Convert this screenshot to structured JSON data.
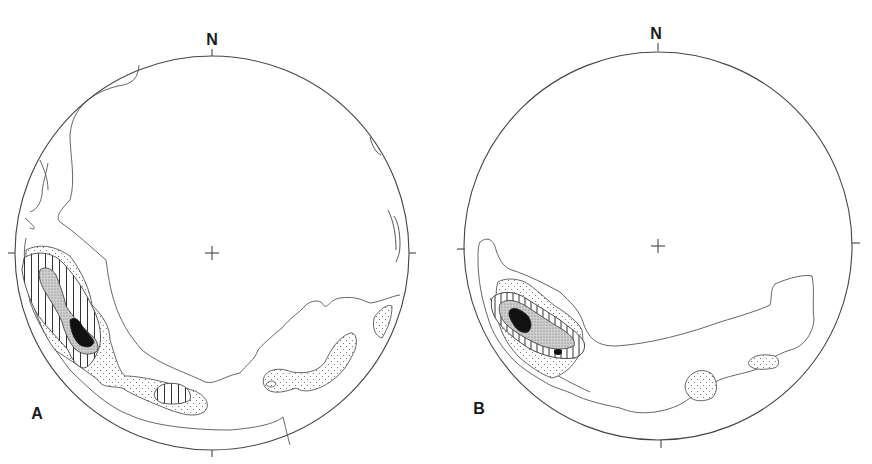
{
  "figure": {
    "panels": [
      {
        "id": "A",
        "panel_label": "A",
        "north_label": "N",
        "projection": "lower-hemisphere equal-area stereonet",
        "center": [
          212,
          253
        ],
        "radius": 197
      },
      {
        "id": "B",
        "panel_label": "B",
        "north_label": "N",
        "projection": "lower-hemisphere equal-area stereonet",
        "center": [
          658,
          246
        ],
        "radius": 194
      }
    ],
    "legend_fills": {
      "level_1": "outline only",
      "level_2": "stipple",
      "level_3": "vertical hatch",
      "level_4": "fine stipple/grey",
      "level_5": "solid black"
    },
    "colors": {
      "line": "#444444",
      "fill_max": "#111111",
      "grey_fill": "#bdbdbd",
      "background": "#ffffff"
    }
  }
}
